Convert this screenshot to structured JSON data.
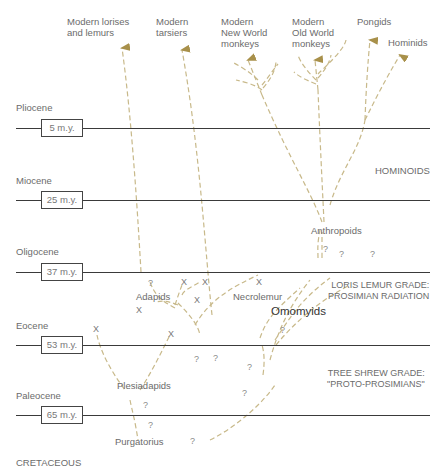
{
  "colors": {
    "branch": "#c8b98a",
    "arrow": "#a8904a",
    "epoch_line": "#3a3a3a",
    "text": "#6b6b6b"
  },
  "epochs": [
    {
      "name": "Pliocene",
      "age": "5 m.y."
    },
    {
      "name": "Miocene",
      "age": "25 m.y."
    },
    {
      "name": "Oligocene",
      "age": "37 m.y."
    },
    {
      "name": "Eocene",
      "age": "53 m.y."
    },
    {
      "name": "Paleocene",
      "age": "65 m.y."
    },
    {
      "name": "CRETACEOUS",
      "age": ""
    }
  ],
  "terminal_taxa": {
    "lorises_lemurs": "Modern lorises\nand lemurs",
    "tarsiers": "Modern\ntarsiers",
    "new_world": "Modern\nNew World\nmonkeys",
    "old_world": "Modern\nOld World\nmonkeys",
    "pongids": "Pongids",
    "hominids": "Hominids"
  },
  "groups": {
    "hominoids": "HOMINOIDS",
    "anthropoids": "Anthropoids",
    "adapids": "Adapids",
    "necrolemur": "Necrolemur",
    "omomyids": "Omomyids",
    "plesiadapids": "Plesiadapids",
    "purgatorius": "Purgatorius"
  },
  "grades": {
    "loris_lemur": "LORIS LEMUR GRADE:\nPROSIMIAN RADIATION",
    "tree_shrew": "TREE SHREW GRADE:\n\"PROTO-PROSIMIANS\""
  },
  "markers": {
    "question": "?",
    "extinct": "X"
  }
}
